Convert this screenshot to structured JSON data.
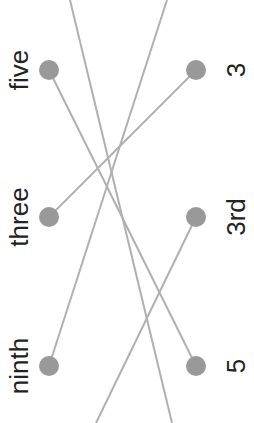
{
  "colors": {
    "line": "#b0b0b0",
    "dot": "#999999",
    "text": "#222222",
    "background": "#ffffff"
  },
  "left_column": {
    "items": [
      {
        "label": "five"
      },
      {
        "label": "three"
      },
      {
        "label": "ninth"
      }
    ]
  },
  "right_column": {
    "items": [
      {
        "label": "3"
      },
      {
        "label": "3rd"
      },
      {
        "label": "5"
      }
    ]
  },
  "connections": [
    {
      "from": "five",
      "to": "5"
    },
    {
      "from": "three",
      "to": "3"
    },
    {
      "from": "ninth",
      "to": "off-screen-top"
    },
    {
      "from": "3rd",
      "to": "off-screen-bottom"
    },
    {
      "from": "off-screen-top",
      "to": "off-screen-bottom"
    }
  ]
}
